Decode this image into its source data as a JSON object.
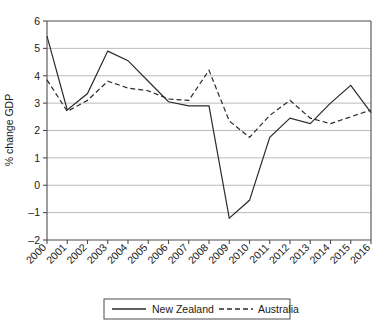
{
  "chart_data": {
    "type": "line",
    "title": "",
    "xlabel": "",
    "ylabel": "% change GDP",
    "ylim": [
      -2,
      6
    ],
    "ytick_values": [
      -2,
      -1,
      0,
      1,
      2,
      3,
      4,
      5,
      6
    ],
    "ytick_labels": [
      "–2",
      "–1",
      "0",
      "1",
      "2",
      "3",
      "4",
      "5",
      "6"
    ],
    "grid": true,
    "grid_axis": "y",
    "legend_position": "bottom-center",
    "categories": [
      "2000",
      "2001",
      "2002",
      "2003",
      "2004",
      "2005",
      "2006",
      "2007",
      "2008",
      "2009",
      "2010",
      "2011",
      "2012",
      "2013",
      "2014",
      "2015",
      "2016"
    ],
    "x": [
      2000,
      2001,
      2002,
      2003,
      2004,
      2005,
      2006,
      2007,
      2008,
      2009,
      2010,
      2011,
      2012,
      2013,
      2014,
      2015,
      2016
    ],
    "series": [
      {
        "name": "New Zealand",
        "style": "solid",
        "color": "#2b2b2b",
        "values": [
          5.45,
          2.75,
          3.35,
          4.9,
          4.55,
          3.8,
          3.05,
          2.9,
          2.9,
          -1.2,
          -0.55,
          1.75,
          2.45,
          2.25,
          3.0,
          3.65,
          2.65
        ]
      },
      {
        "name": "Australia",
        "style": "dashed",
        "color": "#2b2b2b",
        "values": [
          3.85,
          2.7,
          3.1,
          3.8,
          3.55,
          3.45,
          3.15,
          3.1,
          4.2,
          2.35,
          1.75,
          2.55,
          3.1,
          2.45,
          2.25,
          2.5,
          2.75
        ]
      }
    ]
  },
  "legend": {
    "items": [
      {
        "label": "New Zealand",
        "style": "solid"
      },
      {
        "label": "Australia",
        "style": "dashed"
      }
    ]
  },
  "axes": {
    "y_title": "% change GDP"
  }
}
